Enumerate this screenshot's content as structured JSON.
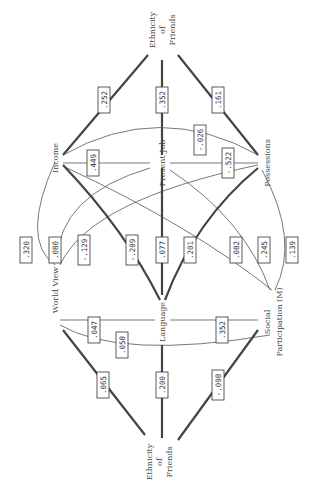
{
  "nodes": {
    "income": "Income",
    "present_job": "Present Job",
    "possessions": "Possessions",
    "world_view": "World View",
    "language": "Language",
    "social_participation_1": "Social",
    "social_participation_2": "Participation (M)",
    "ethnicity_friends_top_left_1": "Ethnicity",
    "ethnicity_friends_top_left_2": "of",
    "ethnicity_friends_top_left_3": "Friends",
    "ethnicity_friends_top_right_1": "Ethnicity",
    "ethnicity_friends_top_right_2": "of",
    "ethnicity_friends_top_right_3": "Friends",
    "ethnicity_friends_bottom_1": "Ethnicity",
    "ethnicity_friends_bottom_2": "of",
    "ethnicity_friends_bottom_3": "Friends"
  },
  "coefficients": {
    "income_eof": ".252",
    "job_eof": ".352",
    "possessions_eof": ".161",
    "job_possessions_curve": "-.026",
    "income_job": ".449",
    "job_possessions": "-.522",
    "income_worldview": ".320",
    "worldview_job": ".080",
    "worldview_possessions": "-.129",
    "income_language": "-.209",
    "job_language": ".077",
    "language_possessions": ".201",
    "income_socpart": ".082",
    "job_socpart": ".245",
    "possessions_socpart": ".139",
    "worldview_language": ".047",
    "worldview_socpart_curve": ".058",
    "language_socpart": ".352",
    "worldview_eof": ".065",
    "language_eof": ".200",
    "socpart_eof": "-.098"
  }
}
